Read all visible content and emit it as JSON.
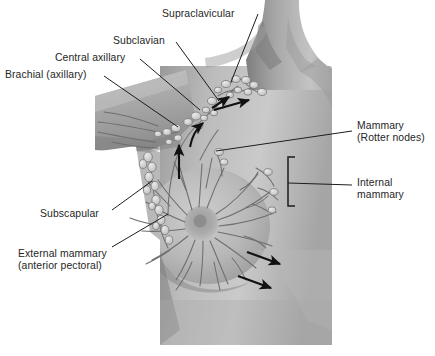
{
  "figure": {
    "kind": "anatomical-illustration",
    "canvas": {
      "width": 435,
      "height": 356
    },
    "palette": {
      "background": "#ffffff",
      "skin_light": "#cfcfcf",
      "skin_mid": "#b4b4b4",
      "skin_dark": "#8e8e8e",
      "skin_shadow": "#6f6f6f",
      "vessel": "#6b6b6b",
      "node_fill": "#dedede",
      "node_stroke": "#777777",
      "leader_line": "#1d1d1d",
      "arrow": "#111111",
      "label_text": "#262626",
      "bracket": "#1d1d1d"
    },
    "body_region": {
      "note": "grayscale photographic torso: neck, right shoulder, raised left arm, breast",
      "left_edge_x": 95,
      "right_edge_x": 332,
      "bottom_y": 345
    }
  },
  "labels": [
    {
      "id": "supraclavicular",
      "text": "Supraclavicular",
      "x": 162,
      "y": 8,
      "side": "left"
    },
    {
      "id": "subclavian",
      "text": "Subclavian",
      "x": 113,
      "y": 35,
      "side": "left"
    },
    {
      "id": "central-axillary",
      "text": "Central axillary",
      "x": 55,
      "y": 52,
      "side": "left"
    },
    {
      "id": "brachial",
      "text": "Brachial (axillary)",
      "x": 5,
      "y": 69,
      "side": "left"
    },
    {
      "id": "mammary",
      "text": "Mammary\n(Rotter nodes)",
      "x": 357,
      "y": 120,
      "side": "right"
    },
    {
      "id": "internal-mammary",
      "text": "Internal\nmammary",
      "x": 357,
      "y": 177,
      "side": "right"
    },
    {
      "id": "subscapular",
      "text": "Subscapular",
      "x": 40,
      "y": 208,
      "side": "left"
    },
    {
      "id": "external-mammary",
      "text": "External mammary\n(anterior pectoral)",
      "x": 18,
      "y": 248,
      "side": "left"
    }
  ],
  "leader_lines": [
    {
      "id": "leader-supraclavicular",
      "from": [
        258,
        14
      ],
      "to": [
        231,
        82
      ]
    },
    {
      "id": "leader-subclavian",
      "from": [
        176,
        42
      ],
      "to": [
        219,
        101
      ]
    },
    {
      "id": "leader-central-axillary",
      "from": [
        140,
        59
      ],
      "to": [
        200,
        110
      ]
    },
    {
      "id": "leader-brachial",
      "from": [
        104,
        76
      ],
      "to": [
        178,
        127
      ]
    },
    {
      "id": "leader-mammary",
      "from": [
        352,
        131
      ],
      "to": [
        216,
        151
      ]
    },
    {
      "id": "leader-internal-mammary",
      "from": [
        352,
        185
      ],
      "to": [
        288,
        183
      ]
    },
    {
      "id": "leader-subscapular",
      "from": [
        112,
        210
      ],
      "to": [
        152,
        181
      ]
    },
    {
      "id": "leader-external-mammary",
      "from": [
        112,
        247
      ],
      "to": [
        168,
        214
      ]
    }
  ],
  "brackets": [
    {
      "id": "bracket-internal-mammary",
      "x": 288,
      "y_top": 157,
      "y_bottom": 206,
      "arm": 7
    }
  ],
  "flow_arrows": [
    {
      "id": "arrow-to-supraclavicular",
      "kind": "straight",
      "from": [
        219,
        112
      ],
      "to": [
        252,
        103
      ]
    },
    {
      "id": "arrow-axillary-curve",
      "kind": "curved",
      "from": [
        191,
        146
      ],
      "to": [
        204,
        122
      ]
    },
    {
      "id": "arrow-axillary-up",
      "kind": "straight",
      "from": [
        179,
        178
      ],
      "to": [
        179,
        143
      ]
    },
    {
      "id": "arrow-supraclav-inflow",
      "kind": "straight",
      "from": [
        214,
        107
      ],
      "to": [
        231,
        96
      ]
    },
    {
      "id": "arrow-lower-outer-1",
      "kind": "straight",
      "from": [
        247,
        253
      ],
      "to": [
        281,
        265
      ]
    },
    {
      "id": "arrow-lower-outer-2",
      "kind": "straight",
      "from": [
        238,
        277
      ],
      "to": [
        272,
        289
      ]
    }
  ],
  "node_groups": [
    {
      "id": "supraclavicular-cluster",
      "count": 9,
      "center": [
        237,
        88
      ]
    },
    {
      "id": "subclavian-cluster",
      "count": 4,
      "center": [
        214,
        104
      ]
    },
    {
      "id": "central-axillary-group",
      "count": 4,
      "center": [
        196,
        116
      ]
    },
    {
      "id": "brachial-group",
      "count": 5,
      "center": [
        173,
        130
      ]
    },
    {
      "id": "subscapular-chain",
      "count": 6,
      "center": [
        150,
        175
      ]
    },
    {
      "id": "external-mammary-chain",
      "count": 7,
      "center": [
        158,
        222
      ]
    },
    {
      "id": "rotter-nodes",
      "count": 2,
      "center": [
        222,
        158
      ]
    },
    {
      "id": "internal-mammary-nodes",
      "count": 3,
      "center": [
        272,
        180
      ]
    }
  ]
}
